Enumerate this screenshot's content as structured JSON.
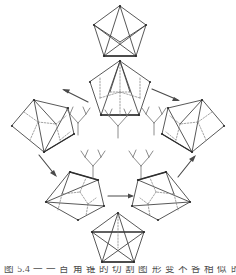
{
  "figure": {
    "background_color": "#ffffff",
    "line_color": "#3a3a3a",
    "dashed_color": "#7d7d7d",
    "arrow_color": "#4a4a4a",
    "caption": "图 5.4  一 一 百 角 锥 的 切 割 图 形 变 不 各 相 似 的 各 种 一 形"
  },
  "nodes": [
    {
      "id": "top",
      "data_name": "pentagon-graph-top",
      "label": "pentagon with full diagonals",
      "position": "top-center",
      "cx": 120,
      "cy": 30,
      "radius": 27,
      "style": "solid-diagonals"
    },
    {
      "id": "upper-middle",
      "data_name": "pentagon-graph-upper-middle",
      "label": "pentagon with dashed interior tree",
      "position": "upper-center",
      "cx": 120,
      "cy": 85,
      "radius": 27,
      "style": "dashed-interior"
    },
    {
      "id": "left",
      "data_name": "pentagon-graph-left",
      "label": "pentagon tilted left with dashed interior",
      "position": "middle-left",
      "cx": 40,
      "cy": 126,
      "radius": 27,
      "style": "dashed-interior-tilted"
    },
    {
      "id": "right",
      "data_name": "pentagon-graph-right",
      "label": "pentagon tilted right with dashed interior",
      "position": "middle-right",
      "cx": 190,
      "cy": 126,
      "radius": 27,
      "style": "dashed-interior-tilted-mirror"
    },
    {
      "id": "lower-left",
      "data_name": "pentagon-graph-lower-left",
      "label": "pentagon lower left with dashed interior",
      "position": "lower-left",
      "cx": 72,
      "cy": 196,
      "radius": 27,
      "style": "dashed-interior-tilted"
    },
    {
      "id": "lower-right",
      "data_name": "pentagon-graph-lower-right",
      "label": "pentagon lower right with dashed interior",
      "position": "lower-right",
      "cx": 162,
      "cy": 196,
      "radius": 27,
      "style": "dashed-interior-tilted-mirror"
    },
    {
      "id": "bottom",
      "data_name": "pentagram-graph-bottom",
      "label": "pentagon containing a pentagram star",
      "position": "bottom-center",
      "cx": 118,
      "cy": 237,
      "radius": 26,
      "style": "pentagram"
    }
  ],
  "arrows": [
    {
      "id": "a1",
      "data_name": "arrow-upper-middle-to-left",
      "from": "upper-middle",
      "to": "left",
      "x1": 88,
      "y1": 102,
      "x2": 62,
      "y2": 89
    },
    {
      "id": "a2",
      "data_name": "arrow-upper-middle-to-right",
      "from": "upper-middle",
      "to": "right",
      "x1": 152,
      "y1": 89,
      "x2": 180,
      "y2": 101
    },
    {
      "id": "a3",
      "data_name": "arrow-left-to-lower-left",
      "from": "left",
      "to": "lower-left",
      "x1": 39,
      "y1": 155,
      "x2": 57,
      "y2": 177
    },
    {
      "id": "a4",
      "data_name": "arrow-lower-right-to-right",
      "from": "lower-right",
      "to": "right",
      "x1": 178,
      "y1": 177,
      "x2": 196,
      "y2": 155
    },
    {
      "id": "a5",
      "data_name": "arrow-lower-left-to-lower-right",
      "from": "lower-left",
      "to": "lower-right",
      "x1": 108,
      "y1": 196,
      "x2": 134,
      "y2": 196
    }
  ],
  "tree_symbols": [
    {
      "id": "t1",
      "data_name": "tree-symbol-center",
      "cx": 118,
      "cy": 125,
      "scale": 1.0,
      "branches": 5,
      "label": "branching tree diagram"
    },
    {
      "id": "t2",
      "data_name": "tree-symbol-left",
      "cx": 78,
      "cy": 122,
      "scale": 0.92,
      "branches": 5,
      "label": "branching tree diagram"
    },
    {
      "id": "t3",
      "data_name": "tree-symbol-right",
      "cx": 154,
      "cy": 122,
      "scale": 0.92,
      "branches": 5,
      "label": "branching tree diagram"
    },
    {
      "id": "t4",
      "data_name": "tree-symbol-lower-left",
      "cx": 93,
      "cy": 166,
      "scale": 0.95,
      "branches": 5,
      "label": "branching tree diagram"
    },
    {
      "id": "t5",
      "data_name": "tree-symbol-lower-right",
      "cx": 141,
      "cy": 166,
      "scale": 0.95,
      "branches": 5,
      "label": "branching tree diagram"
    }
  ]
}
